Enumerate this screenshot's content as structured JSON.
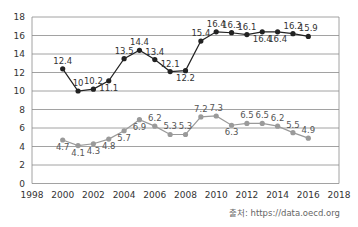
{
  "chart_data": {
    "type": "line",
    "title": "",
    "xlabel": "",
    "ylabel": "",
    "xlim": [
      1998,
      2018
    ],
    "ylim": [
      0,
      18
    ],
    "x_ticks": [
      1998,
      2000,
      2002,
      2004,
      2006,
      2008,
      2010,
      2012,
      2014,
      2016,
      2018
    ],
    "y_ticks": [
      0,
      2,
      4,
      6,
      8,
      10,
      12,
      14,
      16,
      18
    ],
    "grid": true,
    "legend": null,
    "x": [
      2000,
      2001,
      2002,
      2003,
      2004,
      2005,
      2006,
      2007,
      2008,
      2009,
      2010,
      2011,
      2012,
      2013,
      2014,
      2015,
      2016
    ],
    "series": [
      {
        "name": "series-dark",
        "color": "#222222",
        "values": [
          12.4,
          10,
          10.2,
          11.1,
          13.5,
          14.4,
          13.4,
          12.1,
          12.2,
          15.4,
          16.4,
          16.3,
          16.1,
          16.4,
          16.4,
          16.2,
          15.9
        ],
        "label_pos": [
          "a",
          "a",
          "a",
          "b",
          "a",
          "a",
          "a",
          "a",
          "b",
          "a",
          "a",
          "a",
          "a",
          "b",
          "b",
          "a",
          "a"
        ]
      },
      {
        "name": "series-light",
        "color": "#9a9a9a",
        "values": [
          4.7,
          4.1,
          4.3,
          4.8,
          5.7,
          6.9,
          6.2,
          5.3,
          5.3,
          7.2,
          7.3,
          6.3,
          6.5,
          6.5,
          6.2,
          5.5,
          4.9
        ],
        "label_pos": [
          "b",
          "b",
          "b",
          "b",
          "b",
          "b",
          "a",
          "a",
          "a",
          "a",
          "a",
          "b",
          "a",
          "a",
          "a",
          "a",
          "a"
        ]
      }
    ],
    "source": "출처: https://data.oecd.org"
  },
  "colors": {
    "grid": "#8a8a8a",
    "frame": "#8a8a8a"
  }
}
